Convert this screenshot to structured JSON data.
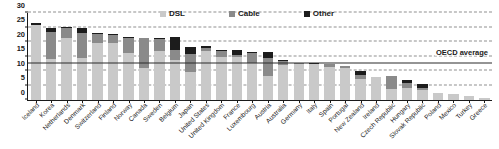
{
  "chart_data": {
    "type": "bar",
    "stacked": true,
    "title": "",
    "xlabel": "",
    "ylabel": "",
    "ylim": [
      0,
      30
    ],
    "yticks": [
      0,
      5,
      10,
      15,
      20,
      25,
      30
    ],
    "grid": true,
    "legend_position": "top-center",
    "legend": [
      "DSL",
      "Cable",
      "Other"
    ],
    "series": [
      {
        "name": "DSL",
        "color": "#c9c9c9",
        "values": [
          25.9,
          14.0,
          21.5,
          14.6,
          19.5,
          19.6,
          16.2,
          11.0,
          17.0,
          13.7,
          9.8,
          17.0,
          14.7,
          14.9,
          12.9,
          8.2,
          12.1,
          12.5,
          12.5,
          11.4,
          10.9,
          7.3,
          8.0,
          3.9,
          4.2,
          3.6,
          2.4,
          2.1,
          1.4,
          0.8
        ]
      },
      {
        "name": "Cable",
        "color": "#8a8a8a",
        "values": [
          0.0,
          9.3,
          3.4,
          8.6,
          3.4,
          2.8,
          5.2,
          10.3,
          4.0,
          3.6,
          6.2,
          1.0,
          2.1,
          0.6,
          3.3,
          6.3,
          1.3,
          0.1,
          0.0,
          0.9,
          0.8,
          1.3,
          0.0,
          4.4,
          1.8,
          0.7,
          0.0,
          0.0,
          0.1,
          0.0
        ]
      },
      {
        "name": "Other",
        "color": "#1c1c1c",
        "values": [
          0.6,
          1.4,
          0.2,
          1.6,
          0.2,
          0.4,
          0.3,
          0.1,
          0.4,
          4.3,
          2.4,
          0.5,
          0.4,
          1.6,
          0.2,
          2.0,
          0.3,
          0.2,
          0.1,
          0.1,
          0.1,
          1.3,
          0.1,
          0.1,
          0.9,
          1.1,
          0.1,
          0.1,
          0.0,
          0.0
        ]
      }
    ],
    "categories": [
      "Iceland",
      "Korea",
      "Netherlands",
      "Denmark",
      "Switzerland",
      "Finland",
      "Norway",
      "Canada",
      "Sweden",
      "Belgium",
      "Japan",
      "United States",
      "United Kingdom",
      "France",
      "Luxembourg",
      "Austria",
      "Australia",
      "Germany",
      "Italy",
      "Spain",
      "Portugal",
      "New Zealand",
      "Ireland",
      "Czech Republic",
      "Hungary",
      "Slovak Republic",
      "Poland",
      "Mexico",
      "Turkey",
      "Greece"
    ],
    "reference_line": {
      "label": "OECD average",
      "value": 12.3,
      "color": "#2b2b2b",
      "style": "solid"
    }
  }
}
